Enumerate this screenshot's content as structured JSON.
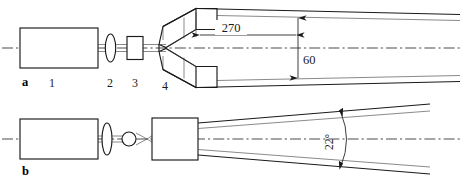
{
  "figure": {
    "background_color": "#ffffff",
    "line_color": "#1a1a1a",
    "width": 462,
    "height": 180
  },
  "panels": [
    {
      "id": "a",
      "label": "a",
      "description": "Laser with collimating lens, aperture and flared horn expander producing a diverging beam"
    },
    {
      "id": "b",
      "label": "b",
      "description": "Laser with lens, pinhole focus and rectangular module producing a 22 degree diverging beam"
    }
  ],
  "part_labels": [
    {
      "id": "1",
      "label": "1",
      "meaning": "laser-body"
    },
    {
      "id": "2",
      "label": "2",
      "meaning": "lens"
    },
    {
      "id": "3",
      "label": "3",
      "meaning": "aperture"
    },
    {
      "id": "4",
      "label": "4",
      "meaning": "horn-expander"
    }
  ],
  "dimensions": [
    {
      "id": "length",
      "value": "270",
      "orientation": "horizontal",
      "panel": "a",
      "meaning": "beam-length"
    },
    {
      "id": "height",
      "value": "60",
      "orientation": "vertical",
      "panel": "a",
      "meaning": "beam-height"
    },
    {
      "id": "divergence",
      "value": "22°",
      "orientation": "angle",
      "panel": "b",
      "meaning": "beam-divergence-angle"
    }
  ]
}
